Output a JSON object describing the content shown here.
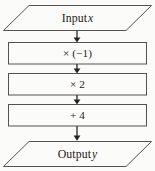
{
  "diagram": {
    "type": "flowchart",
    "orientation": "vertical",
    "colors": {
      "background": "#fbfbfa",
      "shape_fill": "#fbfbfa",
      "shape_stroke": "#55524f",
      "arrow": "#26231f",
      "text": "#1d1a17"
    },
    "nodes": [
      {
        "id": "input",
        "shape": "parallelogram",
        "role": "input",
        "text_prefix": "Input",
        "variable": "x"
      },
      {
        "id": "op1",
        "shape": "rectangle",
        "role": "process",
        "text": "× (−1)"
      },
      {
        "id": "op2",
        "shape": "rectangle",
        "role": "process",
        "text": "× 2"
      },
      {
        "id": "op3",
        "shape": "rectangle",
        "role": "process",
        "text": "+ 4"
      },
      {
        "id": "output",
        "shape": "parallelogram",
        "role": "output",
        "text_prefix": "Output",
        "variable": "y"
      }
    ],
    "connectors": [
      {
        "id": "c1",
        "from": "input",
        "to": "op1",
        "style": "solid-arrow"
      },
      {
        "id": "c2",
        "from": "op1",
        "to": "op2",
        "style": "solid-arrow"
      },
      {
        "id": "c3",
        "from": "op2",
        "to": "op3",
        "style": "solid-arrow"
      },
      {
        "id": "c4",
        "from": "op3",
        "to": "output",
        "style": "solid-arrow"
      }
    ]
  }
}
